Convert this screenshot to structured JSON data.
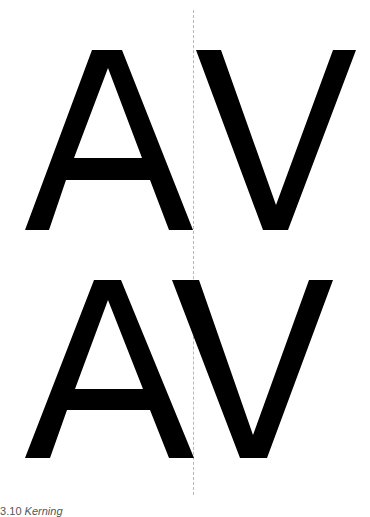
{
  "figure": {
    "rows": [
      {
        "label": "unkerned",
        "letters": [
          "A",
          "V"
        ]
      },
      {
        "label": "kerned",
        "letters": [
          "A",
          "V"
        ]
      }
    ],
    "glyph_color": "#000000",
    "guide_color": "#b8b8b8"
  },
  "caption": {
    "number": "03.10",
    "text": "Kerning"
  }
}
